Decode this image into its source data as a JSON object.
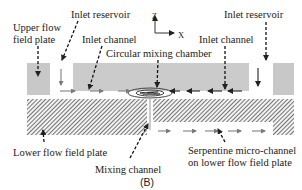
{
  "figure": {
    "panel_label": "(B)",
    "labels": {
      "upper_plate_line1": "Upper flow",
      "upper_plate_line2": "field plate",
      "inlet_reservoir_left": "Inlet reservoir",
      "inlet_reservoir_right": "Inlet reservoir",
      "inlet_channel_left": "Inlet channel",
      "inlet_channel_right": "Inlet channel",
      "circular_mixing_chamber": "Circular mixing chamber",
      "lower_plate": "Lower flow field plate",
      "mixing_channel": "Mixing channel",
      "serpentine_line1": "Serpentine micro-channel",
      "serpentine_line2": "on lower flow field plate"
    },
    "axes": {
      "z_label": "Z",
      "x_label": "X"
    },
    "colors": {
      "upper_plate_fill": "#c8c8c8",
      "lower_plate_hatch": "#555555",
      "arrow": "#333333",
      "flow_arrow": "#8a8a8a"
    }
  }
}
